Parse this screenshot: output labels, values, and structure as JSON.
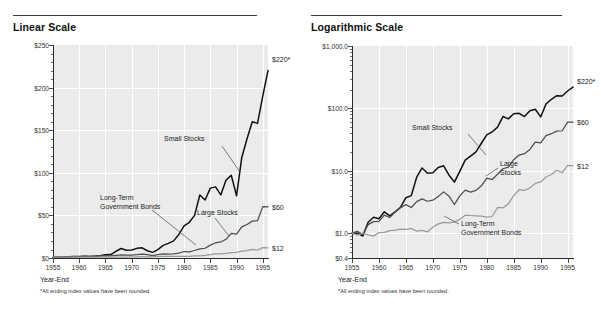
{
  "figure": {
    "footnote": "*All ending index values have been rounded.",
    "xaxis_name": "Year-End"
  },
  "panels": [
    {
      "title": "Linear Scale",
      "endlabels": [
        {
          "text": "$220*",
          "series": "Small Stocks"
        },
        {
          "text": "$60",
          "series": "Large Stocks"
        },
        {
          "text": "$12",
          "series": "Long-Term Government Bonds"
        }
      ],
      "annotations": [
        {
          "text": "Small Stocks"
        },
        {
          "text": "Long-Term\nGovernment Bonds"
        },
        {
          "text": "Large Stocks"
        }
      ]
    },
    {
      "title": "Logarithmic Scale",
      "endlabels": [
        {
          "text": "$220*",
          "series": "Small Stocks"
        },
        {
          "text": "$60",
          "series": "Large Stocks"
        },
        {
          "text": "$12",
          "series": "Long-Term Government Bonds"
        }
      ],
      "annotations": [
        {
          "text": "Small Stocks"
        },
        {
          "text": "Large\nStocks"
        },
        {
          "text": "Long-Term\nGovernment Bonds"
        }
      ]
    }
  ],
  "chart_data": [
    {
      "type": "line",
      "title": "Linear Scale",
      "xlabel": "Year-End",
      "ylabel": "",
      "scale": "linear",
      "xlim": [
        1955,
        1996
      ],
      "ylim": [
        0,
        250
      ],
      "yticks": [
        0,
        50,
        100,
        150,
        200,
        250
      ],
      "yticklabels": [
        "$0",
        "$50",
        "$100",
        "$150",
        "$200",
        "$250"
      ],
      "xticks": [
        1955,
        1960,
        1965,
        1970,
        1975,
        1980,
        1985,
        1990,
        1995
      ],
      "xticklabels": [
        "1955",
        "1960",
        "1965",
        "1970",
        "1975",
        "1980",
        "1985",
        "1990",
        "1995"
      ],
      "grid": "vertical-white",
      "legend": "inline-annotations",
      "x": [
        1955,
        1956,
        1957,
        1958,
        1959,
        1960,
        1961,
        1962,
        1963,
        1964,
        1965,
        1966,
        1967,
        1968,
        1969,
        1970,
        1971,
        1972,
        1973,
        1974,
        1975,
        1976,
        1977,
        1978,
        1979,
        1980,
        1981,
        1982,
        1983,
        1984,
        1985,
        1986,
        1987,
        1988,
        1989,
        1990,
        1991,
        1992,
        1993,
        1994,
        1995,
        1996
      ],
      "series": [
        {
          "name": "Small Stocks",
          "color": "#111111",
          "values": [
            1.0,
            1.0,
            0.9,
            1.5,
            1.8,
            1.7,
            2.2,
            1.9,
            2.2,
            2.6,
            3.7,
            4.0,
            7.9,
            11.1,
            9.1,
            9.3,
            11.3,
            12.0,
            8.5,
            6.6,
            9.8,
            14.8,
            17.2,
            20.1,
            27.6,
            37.6,
            41.9,
            50.0,
            74.0,
            68.0,
            82.0,
            83.5,
            74.0,
            91.5,
            97.0,
            73.0,
            118.0,
            140.0,
            160.0,
            158.0,
            190.0,
            220.0
          ]
        },
        {
          "name": "Large Stocks",
          "color": "#4d4d4d",
          "values": [
            1.0,
            1.07,
            0.95,
            1.37,
            1.53,
            1.54,
            1.95,
            1.78,
            2.19,
            2.55,
            2.87,
            2.58,
            3.2,
            3.55,
            3.25,
            3.38,
            3.86,
            4.59,
            3.92,
            2.88,
            3.95,
            4.9,
            4.55,
            4.85,
            5.74,
            7.61,
            7.23,
            8.79,
            10.77,
            11.44,
            15.07,
            17.88,
            18.81,
            21.94,
            28.88,
            27.99,
            36.51,
            39.3,
            43.25,
            43.82,
            60.3,
            60.0
          ]
        },
        {
          "name": "Long-Term Government Bonds",
          "color": "#9a9a9a",
          "values": [
            1.0,
            0.93,
            1.0,
            0.94,
            0.9,
            1.02,
            1.03,
            1.1,
            1.12,
            1.16,
            1.15,
            1.19,
            1.08,
            1.11,
            1.05,
            1.24,
            1.41,
            1.49,
            1.46,
            1.52,
            1.66,
            1.94,
            1.92,
            1.9,
            1.88,
            1.81,
            1.85,
            2.58,
            2.54,
            2.95,
            4.0,
            4.97,
            4.84,
            5.32,
            6.27,
            6.63,
            7.96,
            8.71,
            10.18,
            9.35,
            12.2,
            12.0
          ]
        }
      ]
    },
    {
      "type": "line",
      "title": "Logarithmic Scale",
      "xlabel": "Year-End",
      "ylabel": "",
      "scale": "log",
      "xlim": [
        1955,
        1996
      ],
      "ylim": [
        0.4,
        1000
      ],
      "yticks": [
        0.4,
        1.0,
        10.0,
        100.0,
        1000.0
      ],
      "yticklabels": [
        "$0.4",
        "$1.0",
        "$10.0",
        "$100.0",
        "$1,000.0"
      ],
      "xticks": [
        1955,
        1960,
        1965,
        1970,
        1975,
        1980,
        1985,
        1990,
        1995
      ],
      "xticklabels": [
        "1955",
        "1960",
        "1965",
        "1970",
        "1975",
        "1980",
        "1985",
        "1990",
        "1995"
      ],
      "grid": "vertical-white",
      "legend": "inline-annotations",
      "x": [
        1955,
        1956,
        1957,
        1958,
        1959,
        1960,
        1961,
        1962,
        1963,
        1964,
        1965,
        1966,
        1967,
        1968,
        1969,
        1970,
        1971,
        1972,
        1973,
        1974,
        1975,
        1976,
        1977,
        1978,
        1979,
        1980,
        1981,
        1982,
        1983,
        1984,
        1985,
        1986,
        1987,
        1988,
        1989,
        1990,
        1991,
        1992,
        1993,
        1994,
        1995,
        1996
      ],
      "series": [
        {
          "name": "Small Stocks",
          "color": "#111111",
          "values": [
            1.0,
            1.0,
            0.9,
            1.5,
            1.8,
            1.7,
            2.2,
            1.9,
            2.2,
            2.6,
            3.7,
            4.0,
            7.9,
            11.1,
            9.1,
            9.3,
            11.3,
            12.0,
            8.5,
            6.6,
            9.8,
            14.8,
            17.2,
            20.1,
            27.6,
            37.6,
            41.9,
            50.0,
            74.0,
            68.0,
            82.0,
            83.5,
            74.0,
            91.5,
            97.0,
            73.0,
            118.0,
            140.0,
            160.0,
            158.0,
            190.0,
            220.0
          ]
        },
        {
          "name": "Large Stocks",
          "color": "#4d4d4d",
          "values": [
            1.0,
            1.07,
            0.95,
            1.37,
            1.53,
            1.54,
            1.95,
            1.78,
            2.19,
            2.55,
            2.87,
            2.58,
            3.2,
            3.55,
            3.25,
            3.38,
            3.86,
            4.59,
            3.92,
            2.88,
            3.95,
            4.9,
            4.55,
            4.85,
            5.74,
            7.61,
            7.23,
            8.79,
            10.77,
            11.44,
            15.07,
            17.88,
            18.81,
            21.94,
            28.88,
            27.99,
            36.51,
            39.3,
            43.25,
            43.82,
            60.3,
            60.0
          ]
        },
        {
          "name": "Long-Term Government Bonds",
          "color": "#9a9a9a",
          "values": [
            1.0,
            0.93,
            1.0,
            0.94,
            0.9,
            1.02,
            1.03,
            1.1,
            1.12,
            1.16,
            1.15,
            1.19,
            1.08,
            1.11,
            1.05,
            1.24,
            1.41,
            1.49,
            1.46,
            1.52,
            1.66,
            1.94,
            1.92,
            1.9,
            1.88,
            1.81,
            1.85,
            2.58,
            2.54,
            2.95,
            4.0,
            4.97,
            4.84,
            5.32,
            6.27,
            6.63,
            7.96,
            8.71,
            10.18,
            9.35,
            12.2,
            12.0
          ]
        }
      ]
    }
  ]
}
